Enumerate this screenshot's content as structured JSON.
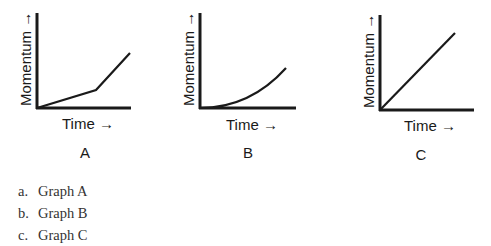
{
  "graphs": [
    {
      "letter": "A",
      "x_label": "Time →",
      "y_label": "Momentum →",
      "shape": "piecewise linear: shallow slope then steeper slope"
    },
    {
      "letter": "B",
      "x_label": "Time →",
      "y_label": "Momentum →",
      "shape": "upward curving (increasing slope)"
    },
    {
      "letter": "C",
      "x_label": "Time →",
      "y_label": "Momentum →",
      "shape": "straight line (constant slope)"
    }
  ],
  "options": [
    {
      "letter": "a.",
      "text": "Graph A"
    },
    {
      "letter": "b.",
      "text": "Graph B"
    },
    {
      "letter": "c.",
      "text": "Graph C"
    }
  ],
  "colors": {
    "line": "#1a1a1a",
    "background": "#ffffff"
  }
}
